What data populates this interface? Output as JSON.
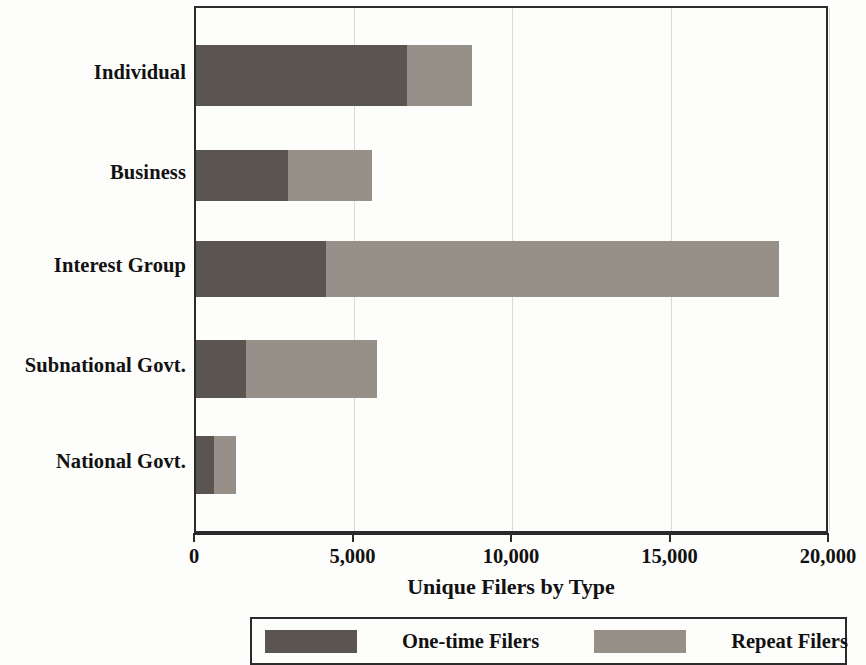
{
  "chart_data": {
    "type": "bar",
    "orientation": "horizontal",
    "stacked": true,
    "title": "",
    "xlabel": "Unique Filers by Type",
    "ylabel": "",
    "categories": [
      "Individual",
      "Business",
      "Interest Group",
      "Subnational Govt.",
      "National Govt."
    ],
    "series": [
      {
        "name": "One-time Filers",
        "color": "#5a5550",
        "values": [
          6650,
          2900,
          4100,
          1590,
          560
        ]
      },
      {
        "name": "Repeat Filers",
        "color": "#969088",
        "values": [
          2050,
          2650,
          14300,
          4110,
          690
        ]
      }
    ],
    "totals": [
      8700,
      5550,
      18400,
      5700,
      1250
    ],
    "xlim": [
      0,
      20000
    ],
    "xticks": [
      0,
      5000,
      10000,
      15000,
      20000
    ],
    "xtick_labels": [
      "0",
      "5,000",
      "10,000",
      "15,000",
      "20,000"
    ],
    "grid": "vertical-light",
    "legend_position": "bottom",
    "legend_entries": [
      "One-time Filers",
      "Repeat Filers"
    ]
  },
  "axis": {
    "x_title": "Unique Filers by Type",
    "ticks": [
      {
        "value": 0,
        "label": "0"
      },
      {
        "value": 5000,
        "label": "5,000"
      },
      {
        "value": 10000,
        "label": "10,000"
      },
      {
        "value": 15000,
        "label": "15,000"
      },
      {
        "value": 20000,
        "label": "20,000"
      }
    ]
  },
  "categories": [
    {
      "label": "Individual"
    },
    {
      "label": "Business"
    },
    {
      "label": "Interest Group"
    },
    {
      "label": "Subnational Govt."
    },
    {
      "label": "National Govt."
    }
  ],
  "legend": {
    "items": [
      {
        "label": "One-time Filers",
        "color": "#5a5550"
      },
      {
        "label": "Repeat Filers",
        "color": "#969088"
      }
    ]
  },
  "colors": {
    "one_time": "#5a5550",
    "repeat": "#969088",
    "axis": "#2b2b2b",
    "grid": "#dedbd4",
    "background": "#fdfdfb"
  }
}
